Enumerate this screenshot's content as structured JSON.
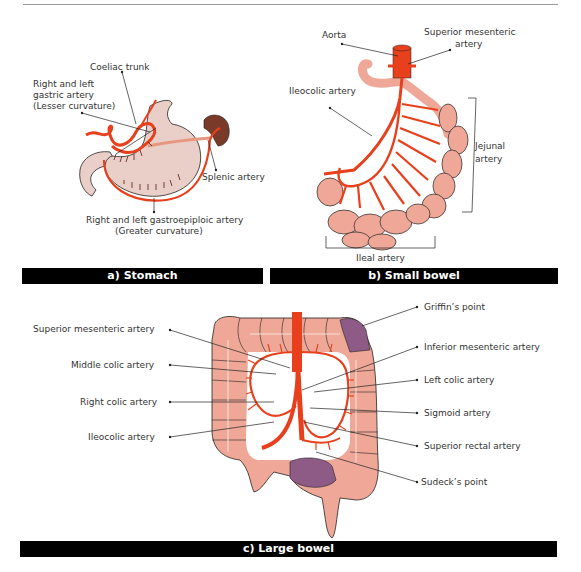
{
  "panels": {
    "stomach": {
      "caption": "a) Stomach",
      "labels": {
        "coeliac_trunk": "Coeliac trunk",
        "gastric_1": "Right and left",
        "gastric_2": "gastric artery",
        "gastric_3": "(Lesser curvature)",
        "splenic": "Splenic artery",
        "gastroepiploic_1": "Right and left gastroepiploic artery",
        "gastroepiploic_2": "(Greater curvature)"
      }
    },
    "small_bowel": {
      "caption": "b) Small bowel",
      "labels": {
        "aorta": "Aorta",
        "sma_1": "Superior mesenteric",
        "sma_2": "artery",
        "ileocolic": "Ileocolic artery",
        "jejunal_1": "Jejunal",
        "jejunal_2": "artery",
        "ileal": "Ileal  artery"
      }
    },
    "large_bowel": {
      "caption": "c) Large bowel",
      "labels": {
        "sma": "Superior mesenteric artery",
        "middle_colic": "Middle colic artery",
        "right_colic": "Right colic artery",
        "ileocolic": "Ileocolic artery",
        "griffins": "Griffin’s point",
        "ima": "Inferior mesenteric artery",
        "left_colic": "Left colic artery",
        "sigmoid": "Sigmoid artery",
        "superior_rectal": "Superior rectal artery",
        "sudecks": "Sudeck’s point"
      }
    }
  },
  "colors": {
    "artery": "#e8401c",
    "stomach": "#e9cfc8",
    "bowel": "#efa898",
    "spleen": "#7a3a2a",
    "watershed": "#8e5a86",
    "caption_bg": "#000000",
    "caption_fg": "#ffffff"
  }
}
